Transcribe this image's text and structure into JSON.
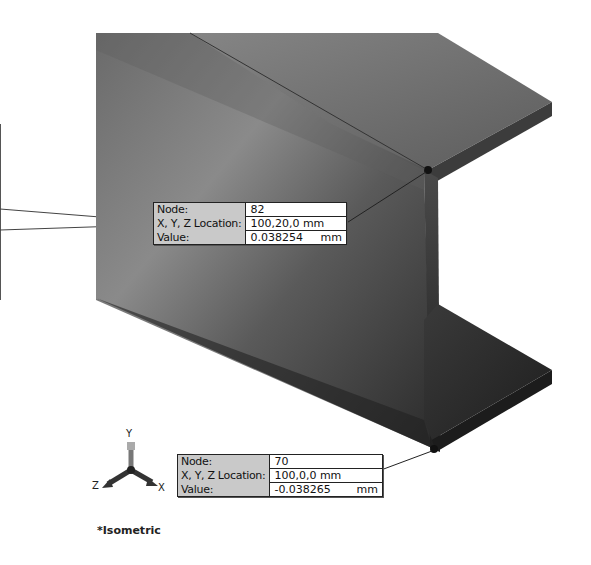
{
  "viewport": {
    "model": "I-beam (structural beam) isometric view",
    "view_name": "*Isometric",
    "colors": {
      "background": "#ffffff",
      "beam_face": "#6e6e6e",
      "beam_dark": "#2e2e2e",
      "probe_label_bg": "#c9c9c9",
      "probe_value_bg": "#ffffff"
    }
  },
  "probes": [
    {
      "id": "upper",
      "rows": [
        {
          "label": "Node:",
          "value": "82",
          "unit": ""
        },
        {
          "label": "X, Y, Z Location:",
          "value": "100,20,0 mm",
          "unit": ""
        },
        {
          "label": "Value:",
          "value": "0.038254",
          "unit": "mm"
        }
      ]
    },
    {
      "id": "lower",
      "rows": [
        {
          "label": "Node:",
          "value": "70",
          "unit": ""
        },
        {
          "label": "X, Y, Z Location:",
          "value": "100,0,0 mm",
          "unit": ""
        },
        {
          "label": "Value:",
          "value": "-0.038265",
          "unit": "mm"
        }
      ]
    }
  ],
  "triad": {
    "axes": {
      "y": "Y",
      "z": "Z",
      "x": "X"
    }
  }
}
